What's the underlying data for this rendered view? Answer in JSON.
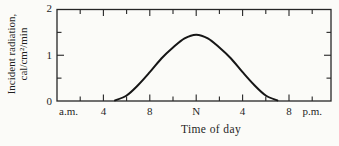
{
  "figure": {
    "ylabel_line1": "Incident radiation,",
    "ylabel_line2": "cal/cm²/min",
    "xlabel": "Time of day"
  },
  "chart_data": {
    "type": "line",
    "title": "",
    "xlabel": "Time of day",
    "ylabel": "Incident radiation, cal/cm²/min",
    "x_unit": "hour of day (0-24)",
    "xlim": [
      0,
      23.6
    ],
    "ylim": [
      0,
      2
    ],
    "grid": false,
    "frame": "closed box with inward ticks on all four sides",
    "legend": "none",
    "x_tick_labels": [
      {
        "hour": 1,
        "label": "a.m."
      },
      {
        "hour": 4,
        "label": "4"
      },
      {
        "hour": 8,
        "label": "8"
      },
      {
        "hour": 12,
        "label": "N"
      },
      {
        "hour": 16,
        "label": "4"
      },
      {
        "hour": 20,
        "label": "8"
      },
      {
        "hour": 22,
        "label": "p.m."
      }
    ],
    "x_minor_tick_step_hours": 2,
    "x_major_tick_every_hours": 4,
    "y_tick_labels": [
      {
        "value": 0,
        "label": "0"
      },
      {
        "value": 1,
        "label": "1"
      },
      {
        "value": 2,
        "label": "2"
      }
    ],
    "y_minor_tick_step": 0.5,
    "series": [
      {
        "name": "incident-solar-radiation",
        "points": [
          [
            5,
            0
          ],
          [
            6,
            0.12
          ],
          [
            7,
            0.35
          ],
          [
            8,
            0.63
          ],
          [
            9,
            0.93
          ],
          [
            10,
            1.17
          ],
          [
            11,
            1.37
          ],
          [
            12,
            1.45
          ],
          [
            13,
            1.37
          ],
          [
            14,
            1.17
          ],
          [
            15,
            0.93
          ],
          [
            16,
            0.63
          ],
          [
            17,
            0.35
          ],
          [
            18,
            0.12
          ],
          [
            19,
            0
          ]
        ]
      }
    ],
    "curve_color": "#161616",
    "ink_color": "#262626",
    "background_color": "#fbfbf8"
  }
}
